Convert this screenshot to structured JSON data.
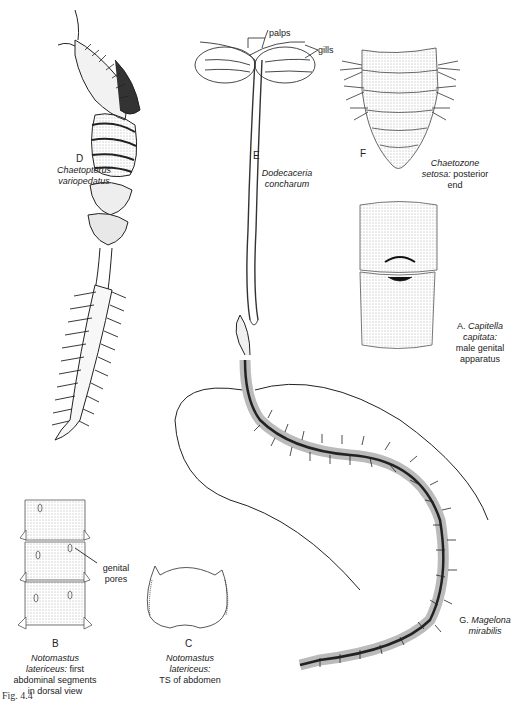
{
  "figure": {
    "caption_fragment": "Fig. 4.4",
    "panels": [
      {
        "id": "A",
        "letter": "A.",
        "genus": "Capitella",
        "species": "capitata:",
        "note": "male genital apparatus",
        "note_lines": [
          "male genital",
          "apparatus"
        ]
      },
      {
        "id": "B",
        "letter": "B",
        "genus": "Notomastus",
        "species": "latericeus:",
        "note_inline": "first",
        "note_lines": [
          "abdominal segments",
          "in dorsal view"
        ],
        "callout": "genital pores",
        "callout_lines": [
          "genital",
          "pores"
        ]
      },
      {
        "id": "C",
        "letter": "C",
        "genus": "Notomastus",
        "species": "latericeus:",
        "note_lines": [
          "TS of abdomen"
        ]
      },
      {
        "id": "D",
        "letter": "D",
        "genus": "Chaetopterus",
        "species": "variopedatus"
      },
      {
        "id": "E",
        "letter": "E",
        "genus": "Dodecaceria",
        "species": "concharum",
        "callouts": [
          "palps",
          "gills"
        ]
      },
      {
        "id": "F",
        "letter": "F",
        "genus": "Chaetozone",
        "species": "setosa:",
        "note_inline": "posterior",
        "note_lines": [
          "end"
        ]
      },
      {
        "id": "G",
        "letter": "G.",
        "genus": "Magelona",
        "species": "mirabilis"
      }
    ]
  }
}
